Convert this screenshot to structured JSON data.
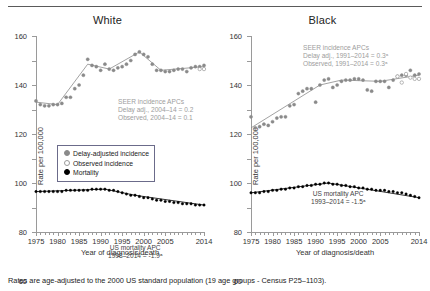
{
  "figure": {
    "footnote": "Rates are age-adjusted to the 2000 US standard population (19 age groups - Census P25–1103)."
  },
  "axes": {
    "ylabel": "Rate per 100,000",
    "xlabel": "Year of diagnosis/death",
    "yticks": [
      0,
      20,
      40,
      60,
      80,
      100,
      120,
      140,
      160
    ],
    "ylim": [
      0,
      160
    ],
    "xticks": [
      1975,
      1980,
      1985,
      1990,
      1995,
      2000,
      2005,
      2014
    ],
    "xlim": [
      1975,
      2014
    ]
  },
  "legend": {
    "items": [
      {
        "label": "Delay-adjusted incidence",
        "marker": "filled-gray-circle"
      },
      {
        "label": "Observed incidence",
        "marker": "open-circle"
      },
      {
        "label": "Mortality",
        "marker": "filled-black-circle"
      }
    ]
  },
  "panels": [
    {
      "title": "White",
      "incidence_note": {
        "line1": "SEER incidence APCs",
        "line2": "Delay adj., 2004–14 = 0.2",
        "line3": "Observed, 2004–14 = 0.1"
      },
      "mortality_note": {
        "line1": "US mortality APC",
        "line2": "1998–2014 = -1.9ᵃ"
      }
    },
    {
      "title": "Black",
      "incidence_note": {
        "line1": "SEER incidence APCs",
        "line2": "Delay adj., 1991–2014 = 0.3ᵃ",
        "line3": "Observed, 1991–2014 = 0.3ᵃ"
      },
      "mortality_note": {
        "line1": "US mortality APC",
        "line2": "1993–2014 = -1.5ᵃ"
      }
    }
  ],
  "chart_data": {
    "type": "scatter",
    "xlabel": "Year of diagnosis/death",
    "ylabel": "Rate per 100,000",
    "xlim": [
      1975,
      2014
    ],
    "ylim": [
      0,
      160
    ],
    "grid": false,
    "legend_position": "left-center",
    "colors": {
      "delay_adjusted": "#8a8a8a",
      "observed": "#9a9a9a",
      "mortality": "#000000",
      "trendline_incidence": "#8a8a8a",
      "trendline_mortality": "#000000",
      "note_text": "#9d9d9d",
      "axis": "#9a9a9a"
    },
    "years": [
      1975,
      1976,
      1977,
      1978,
      1979,
      1980,
      1981,
      1982,
      1983,
      1984,
      1985,
      1986,
      1987,
      1988,
      1989,
      1990,
      1991,
      1992,
      1993,
      1994,
      1995,
      1996,
      1997,
      1998,
      1999,
      2000,
      2001,
      2002,
      2003,
      2004,
      2005,
      2006,
      2007,
      2008,
      2009,
      2010,
      2011,
      2012,
      2013,
      2014
    ],
    "panels": [
      {
        "name": "White",
        "series": [
          {
            "name": "Delay-adjusted incidence",
            "marker": "filled-gray-circle",
            "values": [
              107,
              104,
              103,
              103,
              104,
              104,
              105,
              110,
              110,
              117,
              120,
              128,
              141,
              136,
              135,
              132,
              137,
              133,
              132,
              134,
              135,
              137,
              140,
              145,
              147,
              145,
              143,
              137,
              132,
              132,
              131,
              131,
              132,
              133,
              133,
              131,
              134,
              135,
              135,
              136
            ]
          },
          {
            "name": "Observed incidence",
            "marker": "open-circle",
            "values": [
              null,
              null,
              null,
              null,
              null,
              null,
              null,
              null,
              null,
              null,
              null,
              null,
              null,
              null,
              null,
              null,
              null,
              null,
              null,
              null,
              null,
              null,
              null,
              null,
              null,
              null,
              null,
              null,
              null,
              null,
              null,
              null,
              null,
              null,
              null,
              null,
              null,
              null,
              133,
              133
            ]
          },
          {
            "name": "Mortality",
            "marker": "filled-black-circle",
            "values": [
              33,
              33,
              33,
              33,
              33,
              33,
              33,
              34,
              34,
              34,
              34,
              34,
              34,
              35,
              35,
              35,
              35,
              34,
              34,
              33,
              32,
              31,
              30,
              30,
              29,
              28,
              28,
              27,
              26,
              26,
              25,
              25,
              24,
              24,
              23,
              23,
              23,
              22,
              22,
              22
            ]
          }
        ],
        "trend_segments": [
          {
            "series": "Delay-adjusted incidence",
            "points": [
              [
                1975,
                106
              ],
              [
                1980,
                104
              ],
              [
                1987,
                137
              ],
              [
                1992,
                133
              ],
              [
                1999,
                147
              ],
              [
                2004,
                132
              ],
              [
                2014,
                135
              ]
            ]
          },
          {
            "series": "Mortality",
            "points": [
              [
                1975,
                33
              ],
              [
                1991,
                35
              ],
              [
                1998,
                30
              ],
              [
                2014,
                22
              ]
            ]
          }
        ]
      },
      {
        "name": "Black",
        "series": [
          {
            "name": "Delay-adjusted incidence",
            "marker": "filled-gray-circle",
            "values": [
              94,
              85,
              86,
              88,
              87,
              90,
              93,
              94,
              94,
              103,
              104,
              113,
              115,
              117,
              117,
              106,
              120,
              124,
              125,
              118,
              120,
              123,
              124,
              124,
              125,
              125,
              124,
              116,
              115,
              123,
              123,
              123,
              118,
              124,
              127,
              128,
              128,
              132,
              128,
              129
            ]
          },
          {
            "name": "Observed incidence",
            "marker": "open-circle",
            "values": [
              null,
              null,
              null,
              null,
              null,
              null,
              null,
              null,
              null,
              null,
              null,
              null,
              null,
              null,
              null,
              null,
              null,
              null,
              null,
              null,
              null,
              null,
              null,
              null,
              null,
              null,
              null,
              null,
              null,
              null,
              null,
              null,
              null,
              null,
              127,
              122,
              129,
              126,
              125,
              125
            ]
          },
          {
            "name": "Mortality",
            "marker": "filled-black-circle",
            "values": [
              32,
              32,
              32,
              33,
              33,
              34,
              34,
              35,
              35,
              36,
              36,
              37,
              37,
              38,
              38,
              39,
              39,
              40,
              40,
              39,
              39,
              38,
              38,
              37,
              37,
              36,
              36,
              35,
              35,
              34,
              34,
              34,
              33,
              33,
              32,
              32,
              31,
              30,
              29,
              28
            ]
          }
        ],
        "trend_segments": [
          {
            "series": "Delay-adjusted incidence",
            "points": [
              [
                1975,
                85
              ],
              [
                1991,
                120
              ],
              [
                1996,
                124
              ],
              [
                2005,
                123
              ],
              [
                2014,
                128
              ]
            ]
          },
          {
            "series": "Mortality",
            "points": [
              [
                1975,
                32
              ],
              [
                1993,
                40
              ],
              [
                2014,
                28
              ]
            ]
          }
        ]
      }
    ]
  }
}
